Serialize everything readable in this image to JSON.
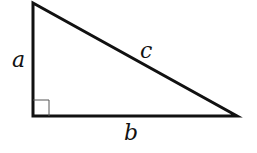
{
  "diagram": {
    "type": "right-triangle",
    "vertices": {
      "top": [
        33,
        3
      ],
      "right_angle": [
        33,
        116
      ],
      "right": [
        237,
        116
      ]
    },
    "right_angle_marker_size": 16,
    "stroke_color": "#111111",
    "labels": {
      "vertical_leg": "a",
      "horizontal_leg": "b",
      "hypotenuse": "c"
    }
  }
}
